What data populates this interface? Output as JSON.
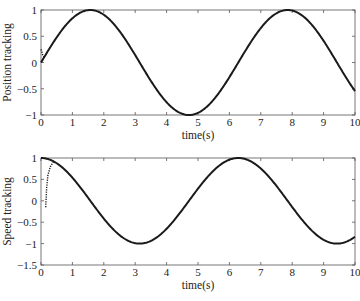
{
  "chart_data": [
    {
      "type": "line",
      "title": "",
      "xlabel": "time(s)",
      "ylabel": "Position tracking",
      "xlim": [
        0,
        10
      ],
      "ylim": [
        -1,
        1
      ],
      "xticks": [
        "0",
        "1",
        "2",
        "3",
        "4",
        "5",
        "6",
        "7",
        "8",
        "9",
        "10"
      ],
      "yticks": [
        "-1",
        "-0.5",
        "0",
        "0.5",
        "1"
      ],
      "grid": false,
      "series": [
        {
          "name": "reference",
          "style": "solid",
          "function": "sin(t)",
          "x_range": [
            0,
            10
          ]
        },
        {
          "name": "actual",
          "style": "dotted",
          "note": "converges to reference within ~0.1 s",
          "points": [
            [
              0,
              0.25
            ],
            [
              0.02,
              0.22
            ],
            [
              0.05,
              0.15
            ],
            [
              0.1,
              0.1
            ]
          ]
        }
      ]
    },
    {
      "type": "line",
      "title": "",
      "xlabel": "time(s)",
      "ylabel": "Speed tracking",
      "xlim": [
        0,
        10
      ],
      "ylim": [
        -1.5,
        1
      ],
      "xticks": [
        "0",
        "1",
        "2",
        "3",
        "4",
        "5",
        "6",
        "7",
        "8",
        "9",
        "10"
      ],
      "yticks": [
        "-1.5",
        "-1",
        "-0.5",
        "0",
        "0.5",
        "1"
      ],
      "grid": false,
      "series": [
        {
          "name": "reference",
          "style": "solid",
          "function": "cos(t)",
          "x_range": [
            0,
            10
          ]
        },
        {
          "name": "actual",
          "style": "dotted",
          "note": "starts near -0.15, rises to meet reference by ~0.4 s",
          "points": [
            [
              0.15,
              -0.15
            ],
            [
              0.16,
              0.0
            ],
            [
              0.18,
              0.3
            ],
            [
              0.22,
              0.6
            ],
            [
              0.3,
              0.8
            ],
            [
              0.4,
              0.92
            ]
          ]
        }
      ]
    }
  ]
}
